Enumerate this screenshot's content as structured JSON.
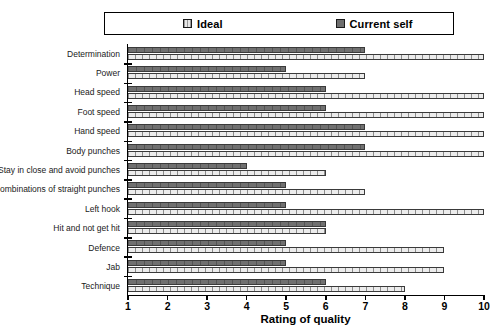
{
  "legend": {
    "entries": [
      {
        "label": "Ideal",
        "key": "ideal",
        "color": "#ececec"
      },
      {
        "label": "Current self",
        "key": "current",
        "color": "#707070"
      }
    ]
  },
  "axis": {
    "x_title": "Rating of quality",
    "x_ticks": [
      "1",
      "2",
      "3",
      "4",
      "5",
      "6",
      "7",
      "8",
      "9",
      "10"
    ],
    "x_min": 1,
    "x_max": 10
  },
  "chart_data": {
    "type": "bar",
    "orientation": "horizontal",
    "title": "",
    "xlabel": "Rating of quality",
    "ylabel": "",
    "xlim": [
      1,
      10
    ],
    "grid": false,
    "legend_position": "top",
    "categories": [
      "Determination",
      "Power",
      "Head speed",
      "Foot speed",
      "Hand speed",
      "Body punches",
      "Stay in close and avoid punches",
      "Combinations of straight punches",
      "Left hook",
      "Hit and not get hit",
      "Defence",
      "Jab",
      "Technique"
    ],
    "series": [
      {
        "name": "Current self",
        "key": "current",
        "values": [
          7,
          5,
          6,
          6,
          7,
          7,
          4,
          5,
          5,
          6,
          5,
          5,
          6
        ]
      },
      {
        "name": "Ideal",
        "key": "ideal",
        "values": [
          10,
          7,
          10,
          10,
          10,
          10,
          6,
          7,
          10,
          6,
          9,
          9,
          8
        ]
      }
    ]
  }
}
